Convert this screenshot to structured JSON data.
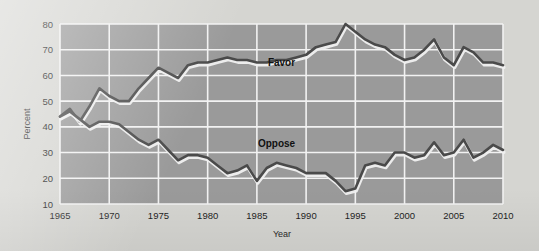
{
  "figure": {
    "name": "line-chart-favor-oppose",
    "page_background": "#d5d5d1",
    "plot_background": "#9a9a9a",
    "gridline_color": "#f2f2f2",
    "line_color": "#4a4a4a",
    "line_shadow_color": "#f0f0f0"
  },
  "chart_data": {
    "type": "line",
    "title": "",
    "xlabel": "Year",
    "ylabel": "Percent",
    "xlim": [
      1965,
      2010
    ],
    "ylim": [
      10,
      80
    ],
    "grid": true,
    "legend_position": "inline-annotation",
    "xticks": [
      1965,
      1970,
      1975,
      1980,
      1985,
      1990,
      1995,
      2000,
      2005,
      2010
    ],
    "xtick_labels": [
      "1965",
      "1970",
      "1975",
      "1980",
      "1985",
      "1990",
      "1995",
      "2000",
      "2005",
      "2010"
    ],
    "yticks": [
      10,
      20,
      30,
      40,
      50,
      60,
      70,
      80
    ],
    "ytick_labels": [
      "10",
      "20",
      "30",
      "40",
      "50",
      "60",
      "70",
      "80"
    ],
    "annotations": [
      {
        "text": "Favor",
        "x": 1987.5,
        "y": 63.5
      },
      {
        "text": "Oppose",
        "x": 1987.0,
        "y": 32.0
      }
    ],
    "series": [
      {
        "name": "Favor",
        "color": "#4a4a4a",
        "x": [
          1965,
          1966,
          1967,
          1968,
          1969,
          1970,
          1971,
          1972,
          1973,
          1974,
          1975,
          1976,
          1977,
          1978,
          1979,
          1980,
          1981,
          1982,
          1983,
          1984,
          1985,
          1986,
          1987,
          1988,
          1989,
          1990,
          1991,
          1992,
          1993,
          1994,
          1995,
          1996,
          1997,
          1998,
          1999,
          2000,
          2001,
          2002,
          2003,
          2004,
          2005,
          2006,
          2007,
          2008,
          2009,
          2010
        ],
        "values": [
          44,
          47,
          42,
          48,
          55,
          52,
          50,
          50,
          55,
          59,
          63,
          61,
          59,
          64,
          65,
          65,
          66,
          67,
          66,
          66,
          65,
          65,
          66,
          66,
          67,
          68,
          71,
          72,
          73,
          80,
          77,
          74,
          72,
          71,
          68,
          66,
          67,
          70,
          74,
          67,
          64,
          71,
          69,
          65,
          65,
          64
        ]
      },
      {
        "name": "Oppose",
        "color": "#4a4a4a",
        "x": [
          1965,
          1966,
          1967,
          1968,
          1969,
          1970,
          1971,
          1972,
          1973,
          1974,
          1975,
          1976,
          1977,
          1978,
          1979,
          1980,
          1981,
          1982,
          1983,
          1984,
          1985,
          1986,
          1987,
          1988,
          1989,
          1990,
          1991,
          1992,
          1993,
          1994,
          1995,
          1996,
          1997,
          1998,
          1999,
          2000,
          2001,
          2002,
          2003,
          2004,
          2005,
          2006,
          2007,
          2008,
          2009,
          2010
        ],
        "values": [
          44,
          46,
          43,
          40,
          42,
          42,
          41,
          38,
          35,
          33,
          35,
          31,
          27,
          29,
          29,
          28,
          25,
          22,
          23,
          25,
          19,
          24,
          26,
          25,
          24,
          22,
          22,
          22,
          19,
          15,
          16,
          25,
          26,
          25,
          30,
          30,
          28,
          29,
          34,
          29,
          30,
          35,
          28,
          30,
          33,
          31
        ]
      }
    ]
  }
}
